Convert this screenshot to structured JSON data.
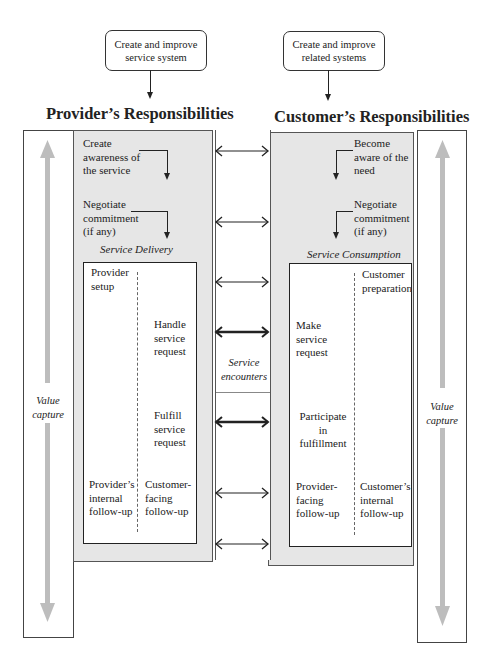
{
  "top_boxes": {
    "provider": "Create and improve service system",
    "customer": "Create and improve related systems"
  },
  "titles": {
    "provider": "Provider’s Responsibilities",
    "customer": "Customer’s Responsibilities"
  },
  "provider": {
    "step1": "Create awareness of the service",
    "step2": "Negotiate commitment (if any)",
    "section_label": "Service Delivery",
    "setup": "Provider setup",
    "handle": "Handle service request",
    "fulfill": "Fulfill service request",
    "internal_followup": "Provider’s internal follow-up",
    "facing_followup": "Customer-facing follow-up",
    "value_capture": "Value capture"
  },
  "customer": {
    "step1": "Become aware of the need",
    "step2": "Negotiate commitment (if any)",
    "section_label": "Service Consumption",
    "preparation": "Customer preparation",
    "make_request": "Make service request",
    "participate": "Participate in fulfillment",
    "facing_followup": "Provider-facing follow-up",
    "internal_followup": "Customer’s internal follow-up",
    "value_capture": "Value capture"
  },
  "middle": {
    "label": "Service encounters",
    "arrows": [
      {
        "y": 151,
        "style": "thin"
      },
      {
        "y": 222,
        "style": "thin"
      },
      {
        "y": 282,
        "style": "thin"
      },
      {
        "y": 332,
        "style": "bold"
      },
      {
        "y": 422,
        "style": "bold"
      },
      {
        "y": 493,
        "style": "thin"
      },
      {
        "y": 544,
        "style": "thin"
      }
    ]
  },
  "colors": {
    "panel_gray": "#e6e6e6",
    "value_arrow": "#bdbdbd",
    "line": "#222222"
  }
}
